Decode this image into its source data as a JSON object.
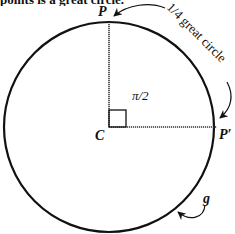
{
  "caption_fragment": "points is a great circle.",
  "labels": {
    "P": "P",
    "P_prime": "P′",
    "C": "C",
    "angle": "π/2",
    "quarter_arc": "1/4 great circle",
    "g": "g"
  },
  "geometry": {
    "center": [
      109,
      127
    ],
    "radius": 105,
    "P": [
      109,
      22
    ],
    "P_prime": [
      217,
      127
    ],
    "right_angle_box": 17
  },
  "colors": {
    "ink": "#111111",
    "background": "#ffffff"
  }
}
